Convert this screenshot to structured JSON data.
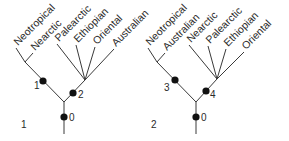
{
  "figure": {
    "panels": [
      {
        "panel_label": "1",
        "taxa": [
          "Neotropical",
          "Nearctic",
          "Palearctic",
          "Ethiopian",
          "Oriental",
          "Australian"
        ],
        "nodes": {
          "root": "0",
          "left": "1",
          "right": "2"
        },
        "groups": {
          "left_clade": [
            "Neotropical",
            "Nearctic"
          ],
          "right_clade": [
            "Palearctic",
            "Ethiopian",
            "Oriental",
            "Australian"
          ]
        }
      },
      {
        "panel_label": "2",
        "taxa": [
          "Neotropical",
          "Australian",
          "Nearctic",
          "Palearctic",
          "Ethiopian",
          "Oriental"
        ],
        "nodes": {
          "root": "0",
          "left": "3",
          "right": "4"
        },
        "groups": {
          "left_clade": [
            "Neotropical",
            "Australian"
          ],
          "right_clade": [
            "Nearctic",
            "Palearctic",
            "Ethiopian",
            "Oriental"
          ]
        }
      }
    ],
    "colors": {
      "line": "#3a3a3a",
      "node": "#111111",
      "text": "#2a2a2a"
    }
  }
}
